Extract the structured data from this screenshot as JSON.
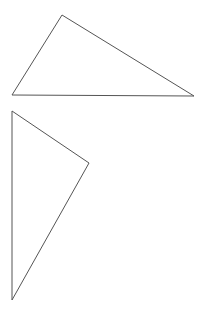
{
  "canvas": {
    "width": 206,
    "height": 320,
    "background": "#ffffff"
  },
  "shapes": [
    {
      "name": "triangle-1",
      "type": "triangle",
      "points": [
        [
          62,
          15
        ],
        [
          12,
          95
        ],
        [
          194,
          96
        ]
      ],
      "stroke": "#555555",
      "fill": "none"
    },
    {
      "name": "triangle-2",
      "type": "triangle",
      "points": [
        [
          12,
          111
        ],
        [
          89,
          163
        ],
        [
          12,
          300
        ]
      ],
      "stroke": "#555555",
      "fill": "none"
    }
  ]
}
